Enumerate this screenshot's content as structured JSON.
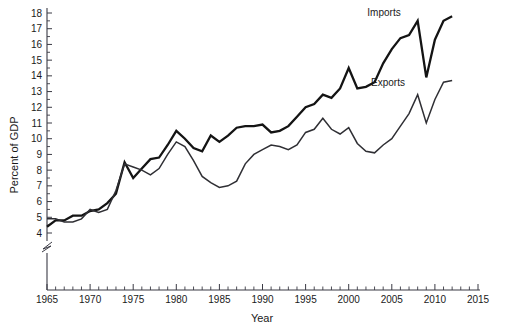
{
  "chart_data": {
    "type": "line",
    "title": "",
    "xlabel": "Year",
    "ylabel": "Percent of GDP",
    "xlim": [
      1965,
      2015
    ],
    "ylim": [
      4,
      18
    ],
    "grid": false,
    "legend_position": "inline-annotation",
    "y_axis_break": true,
    "y_axis_break_note": "axis broken below 4",
    "xticks": [
      1965,
      1970,
      1975,
      1980,
      1985,
      1990,
      1995,
      2000,
      2005,
      2010,
      2015
    ],
    "xtick_labels": [
      "1965",
      "1970",
      "1975",
      "1980",
      "1985",
      "1990",
      "1995",
      "2000",
      "2005",
      "2010",
      "2015"
    ],
    "xtick_minor_step": 1,
    "yticks": [
      4,
      5,
      6,
      7,
      8,
      9,
      10,
      11,
      12,
      13,
      14,
      15,
      16,
      17,
      18
    ],
    "ytick_labels": [
      "4",
      "5",
      "6",
      "7",
      "8",
      "9",
      "10",
      "11",
      "12",
      "13",
      "14",
      "15",
      "16",
      "17",
      "18"
    ],
    "x": [
      1965,
      1966,
      1967,
      1968,
      1969,
      1970,
      1971,
      1972,
      1973,
      1974,
      1975,
      1976,
      1977,
      1978,
      1979,
      1980,
      1981,
      1982,
      1983,
      1984,
      1985,
      1986,
      1987,
      1988,
      1989,
      1990,
      1991,
      1992,
      1993,
      1994,
      1995,
      1996,
      1997,
      1998,
      1999,
      2000,
      2001,
      2002,
      2003,
      2004,
      2005,
      2006,
      2007,
      2008,
      2009,
      2010,
      2011,
      2012
    ],
    "series": [
      {
        "name": "Imports",
        "color": "#141414",
        "linewidth": 2.3,
        "values": [
          4.4,
          4.8,
          4.8,
          5.1,
          5.1,
          5.4,
          5.5,
          5.9,
          6.5,
          8.5,
          7.5,
          8.1,
          8.7,
          8.8,
          9.6,
          10.5,
          10.0,
          9.4,
          9.2,
          10.2,
          9.8,
          10.2,
          10.7,
          10.8,
          10.8,
          10.9,
          10.4,
          10.5,
          10.8,
          11.4,
          12.0,
          12.2,
          12.8,
          12.6,
          13.2,
          14.5,
          13.2,
          13.3,
          13.6,
          14.8,
          15.7,
          16.4,
          16.6,
          17.5,
          13.9,
          16.3,
          17.5,
          17.8
        ]
      },
      {
        "name": "Exports",
        "color": "#2f2f34",
        "linewidth": 1.5,
        "values": [
          4.9,
          4.9,
          4.7,
          4.7,
          4.9,
          5.5,
          5.3,
          5.5,
          6.7,
          8.4,
          8.2,
          8.0,
          7.7,
          8.1,
          9.0,
          9.8,
          9.5,
          8.6,
          7.6,
          7.2,
          6.9,
          7.0,
          7.3,
          8.4,
          9.0,
          9.3,
          9.6,
          9.5,
          9.3,
          9.6,
          10.4,
          10.6,
          11.3,
          10.6,
          10.3,
          10.7,
          9.7,
          9.2,
          9.1,
          9.6,
          10.0,
          10.8,
          11.6,
          12.8,
          11.0,
          12.5,
          13.6,
          13.7
        ]
      }
    ],
    "annotations": [
      {
        "text": "Imports",
        "x_px": 384,
        "y_px": 16
      },
      {
        "text": "Exports",
        "x_px": 388,
        "y_px": 86
      }
    ]
  }
}
